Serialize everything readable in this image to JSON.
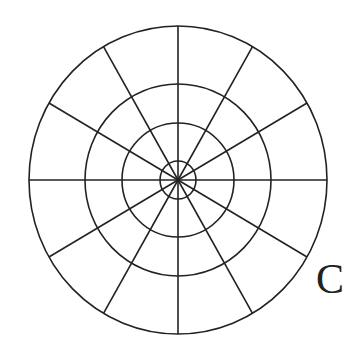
{
  "diagram": {
    "type": "polar-grid",
    "label": "C",
    "center": [
      178,
      180
    ],
    "rings": [
      {
        "rx": 18,
        "ry": 19
      },
      {
        "rx": 56,
        "ry": 57
      },
      {
        "rx": 93,
        "ry": 96
      },
      {
        "rx": 149,
        "ry": 154
      }
    ],
    "spokes": 12,
    "stroke_color": "#222222"
  }
}
